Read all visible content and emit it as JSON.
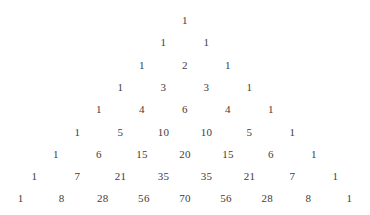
{
  "page": {
    "background_color": "#ffffff",
    "text_color": "#3d3d3d"
  },
  "chart_data": {
    "type": "table",
    "xlabel": "",
    "ylabel": "",
    "rows": [
      [
        1
      ],
      [
        1,
        1
      ],
      [
        1,
        2,
        1
      ],
      [
        1,
        3,
        3,
        1
      ],
      [
        1,
        4,
        6,
        4,
        1
      ],
      [
        1,
        5,
        10,
        10,
        5,
        1
      ],
      [
        1,
        6,
        15,
        20,
        15,
        6,
        1
      ],
      [
        1,
        7,
        21,
        35,
        35,
        21,
        7,
        1
      ],
      [
        1,
        8,
        28,
        56,
        70,
        56,
        28,
        8,
        1
      ]
    ],
    "row_count": 9,
    "layout": {
      "alignment": "centered-pyramid",
      "column_pitch_px": 43,
      "row_pitch_px": 22.3,
      "first_row_top_px": 11,
      "grid": false,
      "legend": "none"
    }
  }
}
